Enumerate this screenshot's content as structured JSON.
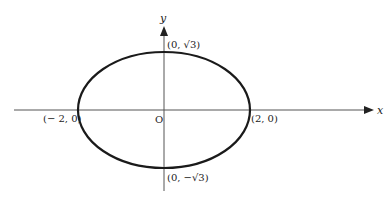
{
  "diagram": {
    "type": "ellipse-on-axes",
    "equation_implied": "x^2/4 + y^2/3 = 1",
    "axes": {
      "x_label": "x",
      "y_label": "y"
    },
    "origin_label": "O",
    "points": [
      {
        "id": "top",
        "label": "(0, √3)"
      },
      {
        "id": "bottom",
        "label": "(0, −√3)"
      },
      {
        "id": "left",
        "label": "(− 2, 0)"
      },
      {
        "id": "right",
        "label": "(2, 0)"
      }
    ],
    "colors": {
      "stroke": "#1a1a1a",
      "axis": "#555555",
      "background": "#ffffff"
    }
  }
}
